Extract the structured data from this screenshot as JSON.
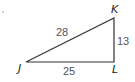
{
  "diagram": {
    "type": "right-triangle",
    "vertices": {
      "J": {
        "label": "J",
        "x": 26,
        "y": 62
      },
      "K": {
        "label": "K",
        "x": 114,
        "y": 18
      },
      "L": {
        "label": "L",
        "x": 114,
        "y": 62
      }
    },
    "sides": {
      "JK": {
        "label": "28"
      },
      "KL": {
        "label": "13"
      },
      "JL": {
        "label": "25"
      }
    },
    "colors": {
      "stroke": "#333333",
      "vertex_text": "#222222",
      "side_text": "#555555"
    }
  }
}
